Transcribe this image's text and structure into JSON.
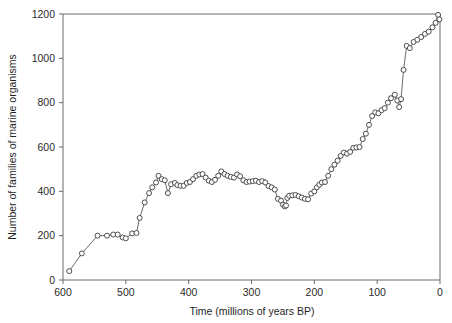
{
  "chart_data": {
    "type": "line",
    "title": "",
    "subtitle": "",
    "xlabel": "Time (millions of years BP)",
    "ylabel": "Number of families of marine organisms",
    "xlim": [
      600,
      0
    ],
    "ylim": [
      0,
      1200
    ],
    "x_reversed": true,
    "grid": false,
    "legend": null,
    "legend_position": "none",
    "marker": "open-circle",
    "xticks": [
      600,
      500,
      400,
      300,
      200,
      100,
      0
    ],
    "xtick_labels": [
      "600",
      "500",
      "400",
      "300",
      "200",
      "100",
      "0"
    ],
    "yticks": [
      0,
      200,
      400,
      600,
      800,
      1000,
      1200
    ],
    "ytick_labels": [
      "0",
      "200",
      "400",
      "600",
      "800",
      "1000",
      "1200"
    ],
    "series": [
      {
        "name": "Marine family diversity",
        "x": [
          590,
          570,
          545,
          530,
          520,
          513,
          505,
          500,
          490,
          483,
          478,
          470,
          463,
          458,
          452,
          448,
          443,
          438,
          433,
          428,
          422,
          418,
          413,
          408,
          403,
          398,
          393,
          388,
          383,
          378,
          373,
          368,
          363,
          358,
          353,
          348,
          343,
          338,
          333,
          328,
          323,
          318,
          313,
          308,
          303,
          298,
          293,
          288,
          283,
          278,
          273,
          268,
          263,
          258,
          253,
          250,
          247,
          245,
          243,
          240,
          235,
          230,
          225,
          220,
          215,
          210,
          205,
          200,
          196,
          192,
          188,
          183,
          178,
          173,
          168,
          163,
          158,
          153,
          148,
          143,
          138,
          133,
          128,
          123,
          118,
          113,
          108,
          103,
          98,
          93,
          88,
          83,
          78,
          72,
          68,
          65,
          62,
          58,
          53,
          48,
          42,
          36,
          30,
          24,
          18,
          12,
          7,
          3,
          1
        ],
        "y": [
          40,
          120,
          200,
          200,
          205,
          205,
          192,
          188,
          210,
          212,
          280,
          350,
          392,
          418,
          440,
          470,
          455,
          450,
          392,
          432,
          438,
          428,
          425,
          425,
          438,
          442,
          455,
          470,
          476,
          478,
          462,
          448,
          442,
          452,
          470,
          490,
          478,
          470,
          465,
          462,
          476,
          468,
          450,
          442,
          444,
          446,
          448,
          442,
          446,
          440,
          424,
          418,
          408,
          366,
          358,
          340,
          332,
          336,
          370,
          380,
          382,
          384,
          378,
          372,
          366,
          364,
          390,
          400,
          418,
          430,
          440,
          442,
          470,
          500,
          520,
          538,
          560,
          575,
          570,
          578,
          596,
          598,
          600,
          636,
          660,
          700,
          740,
          756,
          752,
          766,
          775,
          800,
          820,
          836,
          810,
          780,
          816,
          948,
          1056,
          1046,
          1074,
          1084,
          1096,
          1110,
          1120,
          1140,
          1160,
          1196,
          1176
        ]
      }
    ]
  }
}
